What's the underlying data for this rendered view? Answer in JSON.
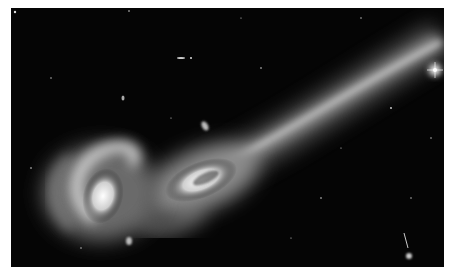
{
  "image": {
    "subject": "interacting galaxy pair with long tidal tail",
    "palette": {
      "background": "#050505",
      "margin": "#ffffff",
      "glow": "#e8e8e8",
      "core": "#ffffff"
    }
  }
}
